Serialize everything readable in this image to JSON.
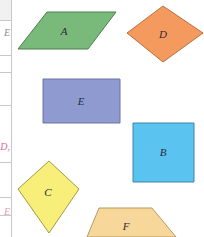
{
  "table_fragment": {
    "row_rules_y": [
      20,
      55,
      72,
      105,
      162,
      197,
      215
    ],
    "fragments": [
      {
        "text": "E",
        "y": 28,
        "color": "#8a8a8a"
      },
      {
        "text": "D,",
        "y": 142,
        "color": "#d86a9a"
      },
      {
        "text": "E",
        "y": 207,
        "color": "#e89ab8"
      }
    ]
  },
  "shapes": [
    {
      "id": "A",
      "label": "A",
      "type": "parallelogram",
      "fill": "#79b97a",
      "stroke": "#4d7f4e",
      "points": "47,12 116,12 88,49 18,49",
      "label_x": 64,
      "label_y": 35
    },
    {
      "id": "D",
      "label": "D",
      "type": "rhombus",
      "fill": "#f59a5e",
      "stroke": "#b8703f",
      "points": "163,6 203,33 163,62 127,33",
      "label_x": 163,
      "label_y": 38
    },
    {
      "id": "E",
      "label": "E",
      "type": "rectangle",
      "fill": "#8f9bd0",
      "stroke": "#6a74a0",
      "points": "43,79 120,79 120,123 43,123",
      "label_x": 81,
      "label_y": 105
    },
    {
      "id": "B",
      "label": "B",
      "type": "square",
      "fill": "#5bc3ef",
      "stroke": "#3a86a8",
      "points": "133,123 194,123 194,182 133,182",
      "label_x": 163,
      "label_y": 156
    },
    {
      "id": "C",
      "label": "C",
      "type": "kite",
      "fill": "#f7ef7a",
      "stroke": "#a49b3e",
      "points": "49,161 79,189 49,233 18,189",
      "label_x": 48,
      "label_y": 196
    },
    {
      "id": "F",
      "label": "F",
      "type": "trapezoid",
      "fill": "#f7d89a",
      "stroke": "#b69a62",
      "points": "99,208 152,208 176,237 87,237",
      "label_x": 126,
      "label_y": 230
    }
  ]
}
